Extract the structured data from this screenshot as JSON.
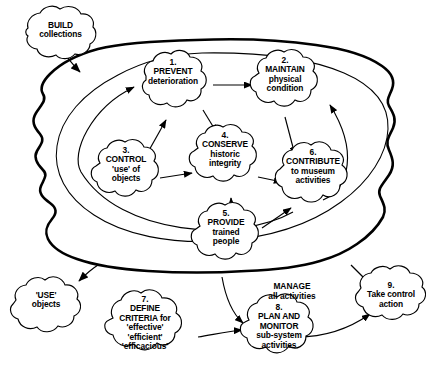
{
  "diagram": {
    "type": "soft-systems conceptual model",
    "stroke_color": "#000000",
    "fill_color": "#ffffff",
    "boundary_outer_name": "system boundary",
    "boundary_inner_name": "sub-system boundary"
  },
  "labels": {
    "manage": {
      "line1": "MANAGE",
      "line2": "all activities"
    }
  },
  "nodes": [
    {
      "id": "build",
      "name": "build-collections",
      "number": "",
      "lines": [
        "BUILD",
        "collections"
      ],
      "inside_boundary": false
    },
    {
      "id": "n1",
      "name": "prevent-deterioration",
      "number": "1.",
      "lines": [
        "PREVENT",
        "deterioration"
      ],
      "inside_boundary": true
    },
    {
      "id": "n2",
      "name": "maintain-physical-condition",
      "number": "2.",
      "lines": [
        "MAINTAIN",
        "physical",
        "condition"
      ],
      "inside_boundary": true
    },
    {
      "id": "n3",
      "name": "control-use-of-objects",
      "number": "3.",
      "lines": [
        "CONTROL",
        "'use' of",
        "objects"
      ],
      "inside_boundary": true
    },
    {
      "id": "n4",
      "name": "conserve-historic-integrity",
      "number": "4.",
      "lines": [
        "CONSERVE",
        "historic",
        "integrity"
      ],
      "inside_boundary": true
    },
    {
      "id": "n5",
      "name": "provide-trained-people",
      "number": "5.",
      "lines": [
        "PROVIDE",
        "trained",
        "people"
      ],
      "inside_boundary": true
    },
    {
      "id": "n6",
      "name": "contribute-to-museum-activities",
      "number": "6.",
      "lines": [
        "CONTRIBUTE",
        "to museum",
        "activities"
      ],
      "inside_boundary": true
    },
    {
      "id": "use",
      "name": "use-objects",
      "number": "",
      "lines": [
        "'USE'",
        "objects"
      ],
      "inside_boundary": false
    },
    {
      "id": "n7",
      "name": "define-criteria",
      "number": "7.",
      "lines": [
        "DEFINE",
        "CRITERIA for",
        "'effective'",
        "'efficient'",
        "'efficacious'"
      ],
      "inside_boundary": false
    },
    {
      "id": "n8",
      "name": "plan-and-monitor",
      "number": "8.",
      "lines": [
        "PLAN AND",
        "MONITOR",
        "sub-system",
        "activities"
      ],
      "inside_boundary": false
    },
    {
      "id": "n9",
      "name": "take-control-action",
      "number": "9.",
      "lines": [
        "Take control",
        "action"
      ],
      "inside_boundary": false
    }
  ],
  "edges": [
    {
      "from": "build",
      "to": "system-boundary"
    },
    {
      "from": "n1",
      "to": "n2"
    },
    {
      "from": "n1",
      "to": "n4"
    },
    {
      "from": "n3",
      "to": "n1"
    },
    {
      "from": "n3",
      "to": "n4"
    },
    {
      "from": "n4",
      "to": "n6"
    },
    {
      "from": "n5",
      "to": "n4"
    },
    {
      "from": "n5",
      "to": "n6"
    },
    {
      "from": "n2",
      "to": "n6"
    },
    {
      "from": "n6",
      "to": "n2"
    },
    {
      "from": "n6",
      "to": "n1"
    },
    {
      "from": "system-boundary",
      "to": "use"
    },
    {
      "from": "system-boundary",
      "to": "n8"
    },
    {
      "from": "system-boundary",
      "to": "n9"
    },
    {
      "from": "n7",
      "to": "n8"
    },
    {
      "from": "n8",
      "to": "n9"
    }
  ]
}
